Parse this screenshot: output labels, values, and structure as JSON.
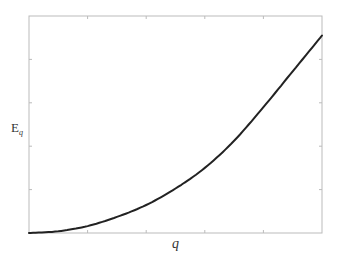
{
  "chart_data": {
    "type": "line",
    "title": "",
    "xlabel": "q",
    "ylabel": "E",
    "ylabel_subscript": "q",
    "xlim": [
      0,
      1
    ],
    "ylim": [
      0,
      1
    ],
    "x_ticks": [
      0.2,
      0.4,
      0.6,
      0.8
    ],
    "y_ticks": [
      0.2,
      0.4,
      0.6,
      0.8
    ],
    "tick_labels_shown": false,
    "grid": false,
    "legend": null,
    "series": [
      {
        "name": "E_q",
        "color": "#222222",
        "x": [
          0.0,
          0.1,
          0.2,
          0.3,
          0.4,
          0.5,
          0.6,
          0.7,
          0.8,
          0.9,
          1.0
        ],
        "y": [
          0.0,
          0.008,
          0.032,
          0.074,
          0.129,
          0.205,
          0.3,
          0.425,
          0.58,
          0.745,
          0.91
        ]
      }
    ]
  },
  "labels": {
    "x": "q",
    "y_main": "E",
    "y_sub": "q"
  },
  "colors": {
    "frame": "#bbbbbb",
    "curve": "#222222",
    "text": "#333333"
  }
}
